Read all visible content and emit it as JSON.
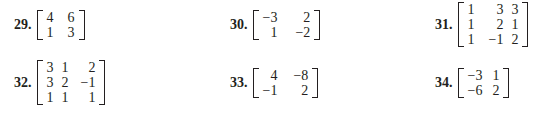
{
  "problems": [
    {
      "number": "29.",
      "rows": [
        [
          "4",
          "6"
        ],
        [
          "1",
          "3"
        ]
      ]
    },
    {
      "number": "30.",
      "rows": [
        [
          "−3",
          "2"
        ],
        [
          "1",
          "−2"
        ]
      ]
    },
    {
      "number": "31.",
      "rows": [
        [
          "1",
          "3",
          "3"
        ],
        [
          "1",
          "2",
          "1"
        ],
        [
          "1",
          "−1",
          "2"
        ]
      ]
    },
    {
      "number": "32.",
      "rows": [
        [
          "3",
          "1",
          "2"
        ],
        [
          "3",
          "2",
          "−1"
        ],
        [
          "1",
          "1",
          "1"
        ]
      ]
    },
    {
      "number": "33.",
      "rows": [
        [
          "4",
          "−8"
        ],
        [
          "−1",
          "2"
        ]
      ]
    },
    {
      "number": "34.",
      "rows": [
        [
          "−3",
          "1"
        ],
        [
          "−6",
          "2"
        ]
      ]
    }
  ]
}
